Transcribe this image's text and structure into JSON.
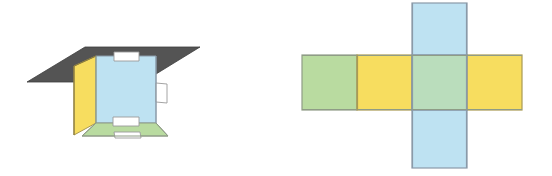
{
  "figure": {
    "title": "Cube and its net",
    "canvas": {
      "width": 552,
      "height": 176,
      "background": "#ffffff"
    },
    "panels": [
      {
        "id": "left",
        "name": "cube-perspective-view",
        "label": "Cube seen from below with flaps"
      },
      {
        "id": "right",
        "name": "cube-net-view",
        "label": "Unfolded cube net (cross layout)"
      }
    ]
  },
  "colors": {
    "blue_fill": "#bee2f2",
    "blue_stroke": "#8a9aa8",
    "green_fill": "#b9dba0",
    "green_stroke": "#8f9c86",
    "yellow_fill": "#f7dd5f",
    "yellow_stroke": "#b0a35a",
    "gray_fill": "#545454",
    "gray_stroke": "#3d3d3d",
    "tab_fill": "#ffffff",
    "tab_stroke": "#9a9a9a",
    "background": "#ffffff"
  },
  "cube": {
    "name": "open-cube-3d",
    "plane": {
      "name": "gray-plane",
      "color": "#545454",
      "shape": "parallelogram",
      "points": "27,82 85,47 200,47 143,82"
    },
    "faces": [
      {
        "name": "cube-face-left",
        "color": "yellow",
        "fill": "#f7dd5f",
        "points": "74,66 96,56 96,123 74,135"
      },
      {
        "name": "cube-face-back",
        "color": "blue",
        "fill": "#bee2f2",
        "points": "96,56 156,56 156,123 96,123"
      },
      {
        "name": "cube-face-bottom",
        "color": "green",
        "fill": "#b9dba0",
        "points": "96,123 156,123 168,136 82,136"
      }
    ],
    "tabs": [
      {
        "name": "tab-top",
        "points": "114,53 138,53 138,61 114,61"
      },
      {
        "name": "tab-right",
        "points": "156,83 166,83 166,103 156,103"
      },
      {
        "name": "tab-bottom-inner",
        "points": "113,118 139,118 139,126 113,126"
      },
      {
        "name": "tab-bottom-outer",
        "points": "113,133 139,133 139,139 113,139"
      }
    ],
    "edges": [
      {
        "name": "edge-left-vertical",
        "from": "74,66",
        "to": "74,135"
      },
      {
        "name": "edge-back-left",
        "from": "96,56",
        "to": "96,123"
      },
      {
        "name": "edge-back-right",
        "from": "156,56",
        "to": "156,123"
      },
      {
        "name": "edge-bottom-front",
        "from": "82,136",
        "to": "168,136"
      }
    ]
  },
  "net": {
    "name": "cube-net-cross",
    "layout": "cross",
    "cell_size": 55,
    "row": {
      "name": "net-horizontal-row",
      "y": 55,
      "x_start": 302,
      "cells": [
        {
          "index": 0,
          "name": "net-cell-left-green",
          "color": "green",
          "fill": "#b9dba0",
          "x": 302,
          "y": 55
        },
        {
          "index": 1,
          "name": "net-cell-mid-yellow",
          "color": "yellow",
          "fill": "#f7dd5f",
          "x": 357,
          "y": 55
        },
        {
          "index": 2,
          "name": "net-cell-center-green",
          "color": "green",
          "fill": "#b9dba0",
          "x": 412,
          "y": 55
        },
        {
          "index": 3,
          "name": "net-cell-right-yellow",
          "color": "yellow",
          "fill": "#f7dd5f",
          "x": 467,
          "y": 55
        }
      ]
    },
    "column": {
      "name": "net-vertical-strip",
      "color": "blue",
      "fill": "#bee2f2",
      "x": 412,
      "y_top": 3,
      "cells": [
        {
          "index": 0,
          "name": "net-cell-top-blue",
          "color": "blue",
          "fill": "#bee2f2",
          "x": 412,
          "y": 3
        },
        {
          "index": 1,
          "name": "net-cell-center-overlap",
          "color": "blue-over-green",
          "x": 412,
          "y": 58
        },
        {
          "index": 2,
          "name": "net-cell-bottom-blue",
          "color": "blue",
          "fill": "#bee2f2",
          "x": 412,
          "y": 113
        }
      ]
    }
  }
}
